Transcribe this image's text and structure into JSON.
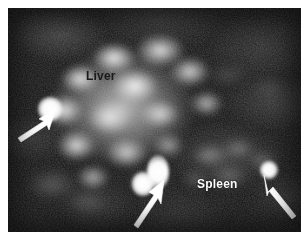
{
  "figure": {
    "kind": "nuclear-medicine-scintigraphy-scan",
    "modality_note": "planar radionuclide liver-spleen scan",
    "background_color": "#ffffff",
    "plate_color": "#121212"
  },
  "labels": {
    "liver": "Liver",
    "spleen": "Spleen",
    "liver_color": "#1b1b1b",
    "spleen_color": "#fbfbfb"
  },
  "annotations": {
    "arrow_color": "#ffffff",
    "arrow_count": 3,
    "arrows": [
      {
        "name": "arrow-left",
        "direction": "up-right",
        "target": "focal-uptake-left-liver-margin"
      },
      {
        "name": "arrow-bottom-center",
        "direction": "up-right",
        "target": "focal-uptake-inferior-midline"
      },
      {
        "name": "arrow-right",
        "direction": "up-left",
        "target": "focal-uptake-right-lateral"
      }
    ]
  },
  "regions": {
    "liver": {
      "label": "Liver",
      "appearance": "large mottled high-uptake mass, left and upper-central field"
    },
    "spleen": {
      "label": "Spleen",
      "appearance": "moderate diffuse uptake, right inferior field"
    }
  },
  "hotspots": [
    {
      "name": "hotspot-left-liver-margin",
      "x": 41,
      "y": 100,
      "r": 11
    },
    {
      "name": "hotspot-inferior-lower",
      "x": 143,
      "y": 183,
      "r": 10
    },
    {
      "name": "hotspot-inferior-upper",
      "x": 158,
      "y": 170,
      "r": 11
    },
    {
      "name": "hotspot-right-lateral",
      "x": 268,
      "y": 170,
      "r": 8
    }
  ]
}
